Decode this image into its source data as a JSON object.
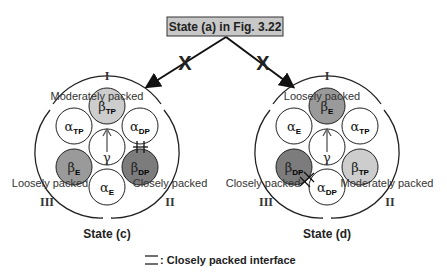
{
  "header": {
    "title": "State (a) in Fig. 3.22",
    "box_fill": "#c8c8c8"
  },
  "transitions": [
    {
      "to": "State (c)",
      "mark": "X"
    },
    {
      "to": "State (d)",
      "mark": "X"
    }
  ],
  "colors": {
    "light_gray": "#cdcdcd",
    "medium_gray": "#9a9a9a",
    "dark_gray": "#7c7c7c",
    "white": "#ffffff"
  },
  "states": [
    {
      "name": "State (c)",
      "interfaces": [
        {
          "numeral": "I",
          "packing": "Moderately packed"
        },
        {
          "numeral": "II",
          "packing": "Closely packed"
        },
        {
          "numeral": "III",
          "packing": "Loosely packed"
        }
      ],
      "subunits": {
        "top": {
          "greek": "β",
          "sub": "TP"
        },
        "upper_left": {
          "greek": "α",
          "sub": "TP"
        },
        "upper_right": {
          "greek": "α",
          "sub": "DP"
        },
        "center": {
          "greek": "γ",
          "sub": ""
        },
        "lower_left": {
          "greek": "β",
          "sub": "E"
        },
        "lower_right": {
          "greek": "β",
          "sub": "DP"
        },
        "bottom": {
          "greek": "α",
          "sub": "E"
        }
      }
    },
    {
      "name": "State (d)",
      "interfaces": [
        {
          "numeral": "I",
          "packing": "Loosely packed"
        },
        {
          "numeral": "II",
          "packing": "Moderately packed"
        },
        {
          "numeral": "III",
          "packing": "Closely packed"
        }
      ],
      "subunits": {
        "top": {
          "greek": "β",
          "sub": "E"
        },
        "upper_left": {
          "greek": "α",
          "sub": "E"
        },
        "upper_right": {
          "greek": "α",
          "sub": "TP"
        },
        "center": {
          "greek": "γ",
          "sub": ""
        },
        "lower_left": {
          "greek": "β",
          "sub": "DP"
        },
        "lower_right": {
          "greek": "β",
          "sub": "TP"
        },
        "bottom": {
          "greek": "α",
          "sub": "DP"
        }
      }
    }
  ],
  "legend": {
    "text": ": Closely packed interface"
  }
}
